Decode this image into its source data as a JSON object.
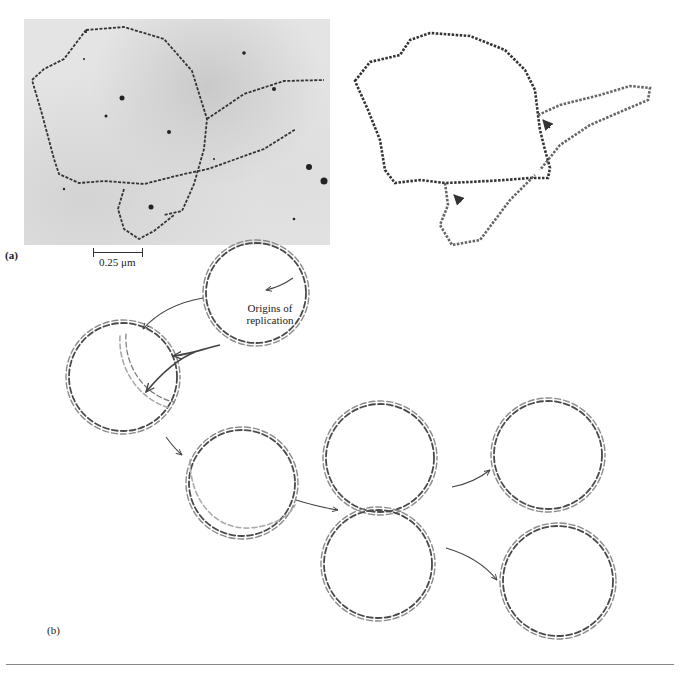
{
  "figure": {
    "panel_a": {
      "label": "(a)",
      "scale_bar": {
        "value": "0.25",
        "unit": "μm",
        "text": "0.25 μm"
      },
      "micrograph": {
        "description": "electron micrograph of replicating circular DNA"
      },
      "tracing": {
        "description": "line tracing of replicating DNA molecule",
        "arrows": 2
      }
    },
    "panel_b": {
      "label": "(b)",
      "annotation": {
        "line1": "Origins of",
        "line2": "replication"
      },
      "circles": [
        {
          "id": "parent",
          "cx": 256,
          "cy": 293,
          "r": 50
        },
        {
          "id": "replicating-early",
          "cx": 123,
          "cy": 377,
          "r": 56
        },
        {
          "id": "replicating-late",
          "cx": 240,
          "cy": 485,
          "r": 57
        },
        {
          "id": "daughter-top",
          "cx": 380,
          "cy": 459,
          "r": 57
        },
        {
          "id": "daughter-bottom",
          "cx": 380,
          "cy": 563,
          "r": 57
        },
        {
          "id": "separated-top",
          "cx": 548,
          "cy": 455,
          "r": 57
        },
        {
          "id": "separated-bottom",
          "cx": 558,
          "cy": 581,
          "r": 58
        }
      ]
    },
    "colors": {
      "strand_dark": "#4a4a4a",
      "strand_light": "#9a9a9a",
      "rule": "#888888"
    }
  }
}
